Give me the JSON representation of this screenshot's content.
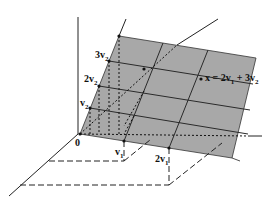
{
  "diagram": {
    "type": "vector-span-plane",
    "colors": {
      "plane_fill": "#a8a8a8",
      "grid_line": "#2a2a2a",
      "dashed_line": "#222222",
      "axis": "#222222",
      "background": "#ffffff"
    },
    "labels": {
      "origin": "0",
      "v1": {
        "base": "v",
        "sub": "1"
      },
      "two_v1": {
        "coef": "2",
        "base": "v",
        "sub": "1"
      },
      "v2": {
        "base": "v",
        "sub": "2"
      },
      "two_v2": {
        "coef": "2",
        "base": "v",
        "sub": "2"
      },
      "three_v2": {
        "coef": "3",
        "base": "v",
        "sub": "2"
      },
      "x_eq": {
        "lhs": "x = 2",
        "v1_base": "v",
        "v1_sub": "1",
        "plus": " + 3",
        "v2_base": "v",
        "v2_sub": "2"
      }
    }
  }
}
